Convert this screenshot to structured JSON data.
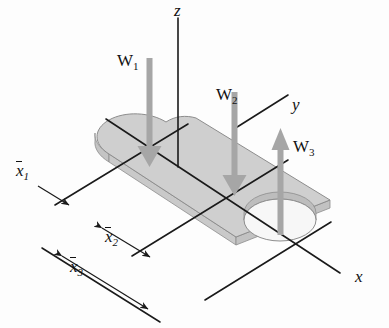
{
  "axes": [
    {
      "name": "z-axis",
      "label": "z",
      "direction": "up"
    },
    {
      "name": "y-axis",
      "label": "y",
      "direction": "upper-right"
    },
    {
      "name": "x-axis",
      "label": "x",
      "direction": "lower-right"
    }
  ],
  "forces": [
    {
      "name": "W1",
      "label": "W",
      "sub": "1",
      "direction": "down",
      "color": "#a6a6a6"
    },
    {
      "name": "W2",
      "label": "W",
      "sub": "2",
      "direction": "down",
      "color": "#a6a6a6"
    },
    {
      "name": "W3",
      "label": "W",
      "sub": "3",
      "direction": "up",
      "color": "#a6a6a6"
    }
  ],
  "dimensions": [
    {
      "name": "x1",
      "label": "x",
      "sub": "1",
      "arrow": "single"
    },
    {
      "name": "x2",
      "label": "x",
      "sub": "2",
      "arrow": "double"
    },
    {
      "name": "x3",
      "label": "x",
      "sub": "3",
      "arrow": "double"
    }
  ],
  "colors": {
    "plate_top": "#cfcfcf",
    "plate_edge": "#b6b6b6",
    "plate_side": "#c4c4c4",
    "hole_inner": "#bdbdbd",
    "hole_floor": "#f2f2f2",
    "arrow": "#a6a6a6",
    "line": "#1a1a1a",
    "background": "#fdfdfd"
  }
}
